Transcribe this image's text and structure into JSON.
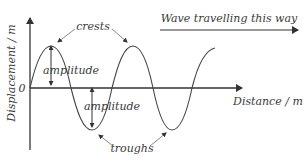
{
  "diagram": {
    "type": "transverse-wave",
    "title": "Wave travelling this way",
    "y_axis_label": "Displacement / m",
    "x_axis_label": "Distance / m",
    "origin_label": "0",
    "labels": {
      "crests": "crests",
      "troughs": "troughs",
      "amplitude_top": "amplitude",
      "amplitude_bottom": "amplitude"
    },
    "colors": {
      "line": "#333333",
      "text": "#3a3a3a",
      "background": "#ffffff"
    }
  }
}
